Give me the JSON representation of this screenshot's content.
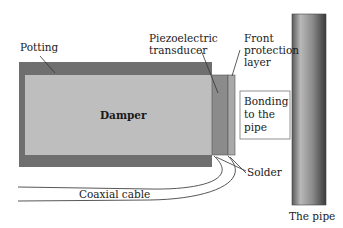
{
  "diagram": {
    "type": "ultrasonic transducer cross-section",
    "labels": {
      "potting": "Potting",
      "piezo_line1": "Piezoelectric",
      "piezo_line2": "transducer",
      "front_line1": "Front",
      "front_line2": "protection",
      "front_line3": "layer",
      "damper": "Damper",
      "bonding_line1": "Bonding",
      "bonding_line2": "to the",
      "bonding_line3": "pipe",
      "solder": "Solder",
      "coax": "Coaxial cable",
      "pipe": "The pipe"
    },
    "colors": {
      "potting": "#6f6f6f",
      "damper": "#bebebe",
      "transducer": "#8b8b8b",
      "front_layer": "#a9a9a9",
      "pipe_light": "#c4c4c4",
      "pipe_dark": "#3e3e3e",
      "line": "#333333"
    }
  }
}
